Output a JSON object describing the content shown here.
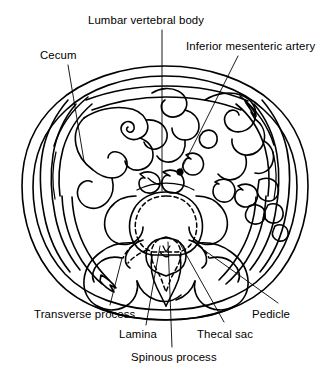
{
  "figure": {
    "type": "anatomical-line-diagram",
    "ink_color": "#000000",
    "background_color": "#ffffff"
  },
  "labels": [
    {
      "id": "lumbar-vertebral-body",
      "text": "Lumbar vertebral body",
      "x": 88,
      "y": 14,
      "leader": [
        [
          162,
          30
        ],
        [
          162,
          191
        ]
      ]
    },
    {
      "id": "inferior-mesenteric-artery",
      "text": "Inferior mesenteric artery",
      "x": 186,
      "y": 40,
      "leader": [
        [
          238,
          56
        ],
        [
          180,
          172
        ]
      ]
    },
    {
      "id": "cecum",
      "text": "Cecum",
      "x": 40,
      "y": 49,
      "leader": [
        [
          68,
          65
        ],
        [
          84,
          161
        ]
      ]
    },
    {
      "id": "transverse-process",
      "text": "Transverse process",
      "x": 34,
      "y": 308,
      "leader": [
        [
          110,
          305
        ],
        [
          122,
          258
        ]
      ]
    },
    {
      "id": "lamina",
      "text": "Lamina",
      "x": 119,
      "y": 328,
      "leader": [
        [
          146,
          325
        ],
        [
          160,
          246
        ]
      ]
    },
    {
      "id": "spinous-process",
      "text": "Spinous process",
      "x": 131,
      "y": 351,
      "leader": [
        [
          172,
          347
        ],
        [
          168,
          242
        ]
      ]
    },
    {
      "id": "thecal-sac",
      "text": "Thecal sac",
      "x": 197,
      "y": 328,
      "leader": [
        [
          224,
          322
        ],
        [
          178,
          240
        ]
      ]
    },
    {
      "id": "pedicle",
      "text": "Pedicle",
      "x": 252,
      "y": 308,
      "leader": [
        [
          278,
          303
        ],
        [
          197,
          245
        ]
      ]
    }
  ],
  "anatomy": {
    "structures": [
      "skin-outer-contour",
      "subcutaneous-fat-layer",
      "abdominal-wall-musculature-left",
      "abdominal-wall-musculature-right",
      "cecum",
      "small-bowel-loops",
      "descending-colon",
      "mesenteric-vessels",
      "inferior-mesenteric-artery",
      "lumbar-vertebral-body",
      "pedicle",
      "lamina",
      "spinous-process",
      "transverse-process",
      "thecal-sac",
      "psoas-muscle",
      "paraspinal-musculature"
    ]
  }
}
